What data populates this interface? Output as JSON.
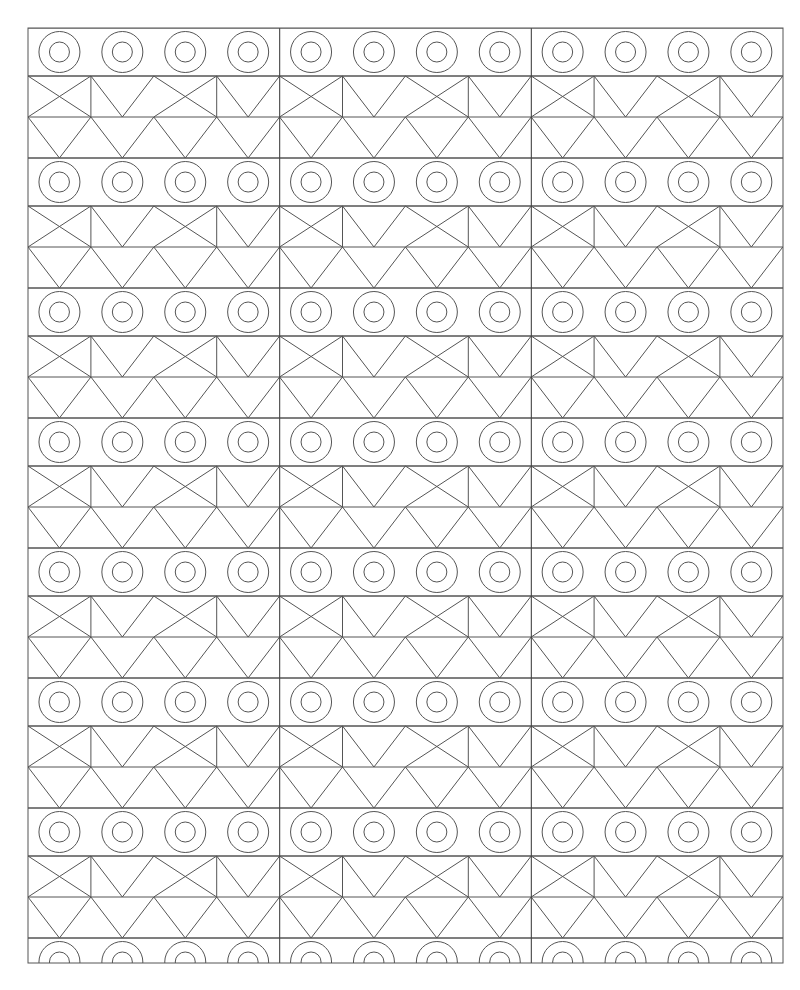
{
  "canvas": {
    "width": 800,
    "height": 990,
    "background_color": "#ffffff",
    "title": "Geometric Band Pattern"
  },
  "style": {
    "stroke_color": "#555555",
    "border_stroke_color": "#555555",
    "divider_stroke_color": "#444444",
    "stroke_width": 1,
    "border_stroke_width": 1,
    "divider_stroke_width": 1.1,
    "fill": "none"
  },
  "frame": {
    "x": 28,
    "y": 28,
    "width": 755,
    "height": 935,
    "label": "outer-border"
  },
  "grid": {
    "column_blocks": 3,
    "cells_per_block": 4,
    "total_columns": 12,
    "cell_width": 62.9,
    "block_width": 251.67,
    "block_divider_x": [
      279.67,
      531.33
    ],
    "circle_band_height": 48,
    "zigzag_band_height": 82,
    "zigzag_subband_height": 41,
    "band_period": 130
  },
  "bands": [
    {
      "index": 0,
      "type": "circles",
      "y": 28,
      "height": 48,
      "complete": true
    },
    {
      "index": 1,
      "type": "zigzag",
      "y": 76,
      "height": 82,
      "complete": true
    },
    {
      "index": 2,
      "type": "circles",
      "y": 158,
      "height": 48,
      "complete": true
    },
    {
      "index": 3,
      "type": "zigzag",
      "y": 206,
      "height": 82,
      "complete": true
    },
    {
      "index": 4,
      "type": "circles",
      "y": 288,
      "height": 48,
      "complete": true
    },
    {
      "index": 5,
      "type": "zigzag",
      "y": 336,
      "height": 82,
      "complete": true
    },
    {
      "index": 6,
      "type": "circles",
      "y": 418,
      "height": 48,
      "complete": true
    },
    {
      "index": 7,
      "type": "zigzag",
      "y": 466,
      "height": 82,
      "complete": true
    },
    {
      "index": 8,
      "type": "circles",
      "y": 548,
      "height": 48,
      "complete": true
    },
    {
      "index": 9,
      "type": "zigzag",
      "y": 596,
      "height": 82,
      "complete": true
    },
    {
      "index": 10,
      "type": "circles",
      "y": 678,
      "height": 48,
      "complete": true
    },
    {
      "index": 11,
      "type": "zigzag",
      "y": 726,
      "height": 82,
      "complete": true
    },
    {
      "index": 12,
      "type": "circles",
      "y": 808,
      "height": 48,
      "complete": true
    },
    {
      "index": 13,
      "type": "zigzag",
      "y": 856,
      "height": 82,
      "complete": true
    },
    {
      "index": 14,
      "type": "circles",
      "y": 938,
      "height": 48,
      "complete": false
    }
  ],
  "motifs": {
    "circle": {
      "name": "concentric-ring",
      "outer_radius": 20.5,
      "inner_radius": 10,
      "count_per_band": 12,
      "description": "Two concentric circles centered in each grid cell"
    },
    "zigzag_upper": {
      "name": "alternating-x-and-v",
      "description": "Upper sub-band: cells alternate between an X (both diagonals) and a V (vertical left edge plus two diagonals meeting at bottom center)",
      "pattern": [
        "X",
        "V",
        "X",
        "V"
      ]
    },
    "zigzag_lower": {
      "name": "triangle-wave",
      "description": "Lower sub-band: continuous zigzag of diagonals forming downward triangles, apex up at cell boundaries"
    }
  },
  "chart_data": {
    "type": "pattern",
    "bands_total": 15,
    "circle_bands": 8,
    "zigzag_bands": 7,
    "circles_total": 96,
    "columns": 12,
    "column_blocks": 3
  }
}
